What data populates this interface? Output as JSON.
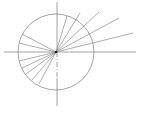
{
  "diagram": {
    "width": 142,
    "height": 114,
    "background": "#ffffff",
    "stroke_color": "#8a8a8a",
    "center": {
      "x": 56,
      "y": 52
    },
    "circle": {
      "cx": 56,
      "cy": 52,
      "r": 38
    },
    "horizontal_axis": {
      "x1": 4,
      "y1": 52,
      "x2": 136,
      "y2": 52
    },
    "vertical_axis_upper": {
      "x1": 57,
      "y1": 2,
      "x2": 57,
      "y2": 52
    },
    "vertical_axis_dashed": {
      "x1": 57,
      "y1": 52,
      "x2": 57,
      "y2": 78
    },
    "vertical_axis_lower": {
      "x1": 57,
      "y1": 78,
      "x2": 57,
      "y2": 106
    },
    "rays_upper_right": [
      {
        "x2": 67,
        "y2": 16
      },
      {
        "x2": 80,
        "y2": 13
      },
      {
        "x2": 99,
        "y2": 12
      },
      {
        "x2": 119,
        "y2": 18
      },
      {
        "x2": 133,
        "y2": 33
      }
    ],
    "rays_left": [
      {
        "x2": 22,
        "y2": 34
      },
      {
        "x2": 19,
        "y2": 43
      },
      {
        "x2": 19,
        "y2": 61
      },
      {
        "x2": 22,
        "y2": 68
      },
      {
        "x2": 26,
        "y2": 74
      },
      {
        "x2": 32,
        "y2": 80
      },
      {
        "x2": 39,
        "y2": 84
      }
    ]
  }
}
